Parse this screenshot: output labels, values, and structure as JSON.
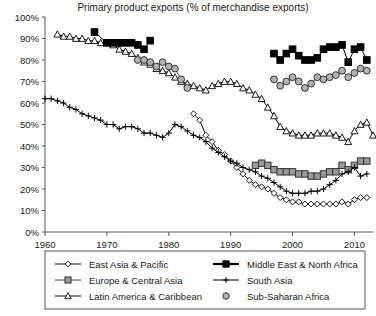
{
  "chart_data": {
    "type": "line",
    "title": "Primary product exports (% of merchandise exports)",
    "xlabel": "",
    "ylabel": "",
    "xlim": [
      1960,
      2013
    ],
    "ylim": [
      0,
      100
    ],
    "grid": false,
    "legend_position": "bottom",
    "xticks": [
      "1960",
      "1970",
      "1980",
      "1990",
      "2000",
      "2010"
    ],
    "xtick_values": [
      1960,
      1970,
      1980,
      1990,
      2000,
      2010
    ],
    "yticks": [
      "0%",
      "10%",
      "20%",
      "30%",
      "40%",
      "50%",
      "60%",
      "70%",
      "80%",
      "90%",
      "100%"
    ],
    "ytick_values": [
      0,
      10,
      20,
      30,
      40,
      50,
      60,
      70,
      80,
      90,
      100
    ],
    "series": [
      {
        "name": "East Asia & Pacific",
        "marker": "diamond-open",
        "color": "#000000",
        "fill": "#ffffff",
        "points": [
          [
            1984,
            55
          ],
          [
            1985,
            52
          ],
          [
            1986,
            45
          ],
          [
            1987,
            42
          ],
          [
            1988,
            38
          ],
          [
            1989,
            36
          ],
          [
            1990,
            33
          ],
          [
            1991,
            30
          ],
          [
            1992,
            27
          ],
          [
            1993,
            24
          ],
          [
            1994,
            22
          ],
          [
            1995,
            21
          ],
          [
            1996,
            20
          ],
          [
            1997,
            18
          ],
          [
            1998,
            16
          ],
          [
            1999,
            15
          ],
          [
            2000,
            14
          ],
          [
            2001,
            14
          ],
          [
            2002,
            13
          ],
          [
            2003,
            13
          ],
          [
            2004,
            13
          ],
          [
            2005,
            13
          ],
          [
            2006,
            13
          ],
          [
            2007,
            13
          ],
          [
            2008,
            14
          ],
          [
            2009,
            13
          ],
          [
            2010,
            15
          ],
          [
            2011,
            16
          ],
          [
            2012,
            16
          ]
        ]
      },
      {
        "name": "Europe & Central Asia",
        "marker": "square-gray",
        "color": "#3d3d3d",
        "fill": "#9a9a9a",
        "points": [
          [
            1994,
            31
          ],
          [
            1995,
            32
          ],
          [
            1996,
            31
          ],
          [
            1997,
            29
          ],
          [
            1998,
            28
          ],
          [
            1999,
            28
          ],
          [
            2000,
            28
          ],
          [
            2001,
            27
          ],
          [
            2002,
            27
          ],
          [
            2003,
            26
          ],
          [
            2004,
            26
          ],
          [
            2005,
            27
          ],
          [
            2006,
            28
          ],
          [
            2007,
            28
          ],
          [
            2008,
            31
          ],
          [
            2009,
            29
          ],
          [
            2010,
            31
          ],
          [
            2011,
            33
          ],
          [
            2012,
            33
          ]
        ]
      },
      {
        "name": "Latin America & Caribbean",
        "marker": "triangle-open",
        "color": "#000000",
        "fill": "#ffffff",
        "points": [
          [
            1962,
            92
          ],
          [
            1963,
            91
          ],
          [
            1964,
            91
          ],
          [
            1965,
            90
          ],
          [
            1966,
            90
          ],
          [
            1967,
            89
          ],
          [
            1968,
            89
          ],
          [
            1969,
            88
          ],
          [
            1970,
            88
          ],
          [
            1971,
            87
          ],
          [
            1972,
            85
          ],
          [
            1973,
            84
          ],
          [
            1974,
            83
          ],
          [
            1975,
            81
          ],
          [
            1976,
            79
          ],
          [
            1977,
            78
          ],
          [
            1978,
            76
          ],
          [
            1979,
            75
          ],
          [
            1980,
            74
          ],
          [
            1981,
            72
          ],
          [
            1982,
            70
          ],
          [
            1983,
            69
          ],
          [
            1984,
            68
          ],
          [
            1985,
            67
          ],
          [
            1986,
            66
          ],
          [
            1987,
            68
          ],
          [
            1988,
            69
          ],
          [
            1989,
            70
          ],
          [
            1990,
            70
          ],
          [
            1991,
            69
          ],
          [
            1992,
            67
          ],
          [
            1993,
            66
          ],
          [
            1994,
            64
          ],
          [
            1995,
            62
          ],
          [
            1996,
            58
          ],
          [
            1997,
            54
          ],
          [
            1998,
            49
          ],
          [
            1999,
            47
          ],
          [
            2000,
            46
          ],
          [
            2001,
            45
          ],
          [
            2002,
            45
          ],
          [
            2003,
            45
          ],
          [
            2004,
            46
          ],
          [
            2005,
            46
          ],
          [
            2006,
            46
          ],
          [
            2007,
            45
          ],
          [
            2008,
            44
          ],
          [
            2009,
            42
          ],
          [
            2010,
            47
          ],
          [
            2011,
            50
          ],
          [
            2012,
            51
          ],
          [
            2013,
            45
          ]
        ]
      },
      {
        "name": "Middle East & North Africa",
        "marker": "square-filled",
        "color": "#000000",
        "fill": "#000000",
        "points": [
          [
            1968,
            93
          ],
          [
            1970,
            88
          ],
          [
            1971,
            88
          ],
          [
            1972,
            88
          ],
          [
            1973,
            88
          ],
          [
            1974,
            88
          ],
          [
            1975,
            87
          ],
          [
            1976,
            85
          ],
          [
            1977,
            89
          ],
          [
            1997,
            83
          ],
          [
            1998,
            80
          ],
          [
            1999,
            83
          ],
          [
            2000,
            85
          ],
          [
            2001,
            82
          ],
          [
            2002,
            80
          ],
          [
            2003,
            80
          ],
          [
            2004,
            81
          ],
          [
            2005,
            85
          ],
          [
            2006,
            86
          ],
          [
            2007,
            86
          ],
          [
            2008,
            87
          ],
          [
            2009,
            79
          ],
          [
            2010,
            85
          ],
          [
            2011,
            86
          ],
          [
            2012,
            80
          ]
        ]
      },
      {
        "name": "South Asia",
        "marker": "plus",
        "color": "#000000",
        "fill": "none",
        "points": [
          [
            1960,
            62
          ],
          [
            1961,
            62
          ],
          [
            1962,
            61
          ],
          [
            1963,
            60
          ],
          [
            1964,
            58
          ],
          [
            1965,
            57
          ],
          [
            1966,
            55
          ],
          [
            1967,
            54
          ],
          [
            1968,
            53
          ],
          [
            1969,
            52
          ],
          [
            1970,
            50
          ],
          [
            1971,
            50
          ],
          [
            1972,
            48
          ],
          [
            1973,
            49
          ],
          [
            1974,
            49
          ],
          [
            1975,
            48
          ],
          [
            1976,
            46
          ],
          [
            1977,
            46
          ],
          [
            1978,
            45
          ],
          [
            1979,
            44
          ],
          [
            1980,
            46
          ],
          [
            1981,
            50
          ],
          [
            1982,
            49
          ],
          [
            1983,
            47
          ],
          [
            1984,
            45
          ],
          [
            1985,
            44
          ],
          [
            1986,
            42
          ],
          [
            1987,
            39
          ],
          [
            1988,
            37
          ],
          [
            1989,
            35
          ],
          [
            1990,
            33
          ],
          [
            1991,
            32
          ],
          [
            1992,
            30
          ],
          [
            1993,
            29
          ],
          [
            1994,
            28
          ],
          [
            1995,
            26
          ],
          [
            1996,
            25
          ],
          [
            1997,
            23
          ],
          [
            1998,
            21
          ],
          [
            1999,
            19
          ],
          [
            2000,
            18
          ],
          [
            2001,
            18
          ],
          [
            2002,
            18
          ],
          [
            2003,
            19
          ],
          [
            2004,
            19
          ],
          [
            2005,
            20
          ],
          [
            2006,
            22
          ],
          [
            2007,
            24
          ],
          [
            2008,
            27
          ],
          [
            2009,
            28
          ],
          [
            2010,
            30
          ],
          [
            2011,
            26
          ],
          [
            2012,
            27
          ]
        ]
      },
      {
        "name": "Sub-Saharan Africa",
        "marker": "circle-gray",
        "color": "#3d3d3d",
        "fill": "#b3b3b3",
        "points": [
          [
            1975,
            80
          ],
          [
            1976,
            80
          ],
          [
            1977,
            79
          ],
          [
            1978,
            77
          ],
          [
            1979,
            79
          ],
          [
            1980,
            77
          ],
          [
            1981,
            76
          ],
          [
            1982,
            71
          ],
          [
            1983,
            67
          ],
          [
            1997,
            71
          ],
          [
            1998,
            68
          ],
          [
            1999,
            70
          ],
          [
            2000,
            72
          ],
          [
            2001,
            70
          ],
          [
            2002,
            67
          ],
          [
            2003,
            69
          ],
          [
            2004,
            72
          ],
          [
            2005,
            71
          ],
          [
            2006,
            72
          ],
          [
            2007,
            73
          ],
          [
            2008,
            75
          ],
          [
            2009,
            72
          ],
          [
            2010,
            74
          ],
          [
            2011,
            76
          ],
          [
            2012,
            75
          ]
        ]
      }
    ],
    "legend": [
      {
        "label": "East Asia & Pacific",
        "marker": "diamond-open"
      },
      {
        "label": "Middle East & North Africa",
        "marker": "square-filled"
      },
      {
        "label": "Europe & Central Asia",
        "marker": "square-gray"
      },
      {
        "label": "South Asia",
        "marker": "plus"
      },
      {
        "label": "Latin America & Caribbean",
        "marker": "triangle-open"
      },
      {
        "label": "Sub-Saharan Africa",
        "marker": "circle-gray"
      }
    ]
  }
}
